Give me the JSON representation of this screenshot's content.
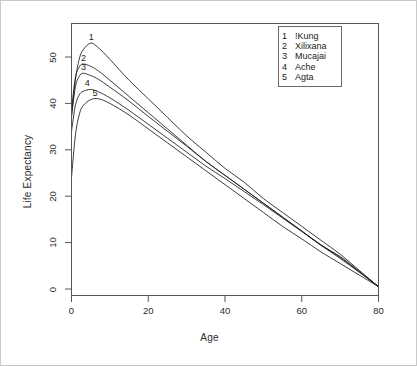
{
  "chart_data": {
    "type": "line",
    "title": "",
    "xlabel": "Age",
    "ylabel": "Life Expectancy",
    "xlim": [
      0,
      80
    ],
    "ylim": [
      0,
      55
    ],
    "xticks": [
      0,
      20,
      40,
      60,
      80
    ],
    "yticks": [
      0,
      10,
      20,
      30,
      40,
      50
    ],
    "grid": false,
    "legend_position": "top-right",
    "legend_title": "",
    "x": [
      0,
      1,
      2,
      3,
      5,
      7,
      10,
      15,
      20,
      25,
      30,
      35,
      40,
      45,
      50,
      55,
      60,
      65,
      70,
      75,
      80
    ],
    "series": [
      {
        "name": "!Kung",
        "key": "1",
        "label": "1",
        "peak_age": 5,
        "peak_value": 53.0,
        "values": [
          37.5,
          45.0,
          49.5,
          51.5,
          53.0,
          52.0,
          49.5,
          45.0,
          41.0,
          37.0,
          33.0,
          29.5,
          26.0,
          23.0,
          19.5,
          16.5,
          13.5,
          10.5,
          7.5,
          4.0,
          0.5
        ]
      },
      {
        "name": "Xilixana",
        "key": "2",
        "label": "2",
        "peak_age": 3,
        "peak_value": 48.5,
        "values": [
          38.5,
          45.5,
          47.8,
          48.5,
          48.0,
          47.0,
          45.0,
          41.5,
          38.0,
          34.5,
          31.0,
          27.5,
          24.5,
          21.5,
          18.5,
          15.5,
          12.5,
          9.5,
          7.0,
          3.8,
          0.5
        ]
      },
      {
        "name": "Mucajai",
        "key": "3",
        "label": "3",
        "peak_age": 3,
        "peak_value": 46.5,
        "values": [
          37.0,
          43.5,
          45.8,
          46.5,
          46.0,
          45.2,
          43.5,
          40.5,
          37.2,
          34.0,
          30.8,
          27.5,
          24.5,
          21.5,
          18.5,
          15.5,
          12.5,
          9.5,
          6.8,
          3.7,
          0.5
        ]
      },
      {
        "name": "Ache",
        "key": "4",
        "label": "4",
        "peak_age": 4,
        "peak_value": 43.0,
        "values": [
          34.0,
          39.5,
          41.8,
          42.6,
          43.0,
          42.5,
          41.2,
          38.5,
          35.5,
          32.5,
          29.5,
          26.5,
          23.8,
          21.0,
          18.2,
          15.3,
          12.4,
          9.4,
          6.6,
          3.6,
          0.5
        ]
      },
      {
        "name": "Agta",
        "key": "5",
        "label": "5",
        "peak_age": 6,
        "peak_value": 41.0,
        "values": [
          24.0,
          33.0,
          37.5,
          39.5,
          40.8,
          41.0,
          40.0,
          37.5,
          34.5,
          31.5,
          28.5,
          25.5,
          22.5,
          19.5,
          16.5,
          13.5,
          10.8,
          8.0,
          5.5,
          3.0,
          0.5
        ]
      }
    ]
  },
  "legend": {
    "entries": [
      {
        "key": "1",
        "name": "!Kung"
      },
      {
        "key": "2",
        "name": "Xilixana"
      },
      {
        "key": "3",
        "name": "Mucajai"
      },
      {
        "key": "4",
        "name": "Ache"
      },
      {
        "key": "5",
        "name": "Agta"
      }
    ]
  },
  "axes": {
    "x_title": "Age",
    "y_title": "Life Expectancy",
    "x_tick_labels": [
      "0",
      "20",
      "40",
      "60",
      "80"
    ],
    "y_tick_labels": [
      "0",
      "10",
      "20",
      "30",
      "40",
      "50"
    ]
  },
  "curve_tags": [
    "1",
    "2",
    "3",
    "4",
    "5"
  ]
}
